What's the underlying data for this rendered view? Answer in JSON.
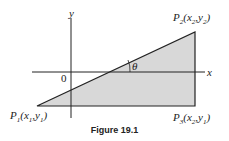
{
  "figure": {
    "caption": "Figure 19.1",
    "axes": {
      "x_label": "x",
      "y_label": "y",
      "origin_label": "0"
    },
    "angle_label": "θ",
    "points": [
      {
        "name": "P1",
        "P": "P",
        "sub": "1",
        "coords": "(x1,y1)",
        "x": "x",
        "xs": "1",
        "y": "y",
        "ys": "1"
      },
      {
        "name": "P2",
        "P": "P",
        "sub": "2",
        "coords": "(x2,y2)",
        "x": "x",
        "xs": "2",
        "y": "y",
        "ys": "2"
      },
      {
        "name": "P3",
        "P": "P",
        "sub": "3",
        "coords": "(x2,y1)",
        "x": "x",
        "xs": "2",
        "y": "y",
        "ys": "1"
      }
    ],
    "colors": {
      "fill": "#d8d8d8",
      "stroke": "#222222"
    }
  }
}
